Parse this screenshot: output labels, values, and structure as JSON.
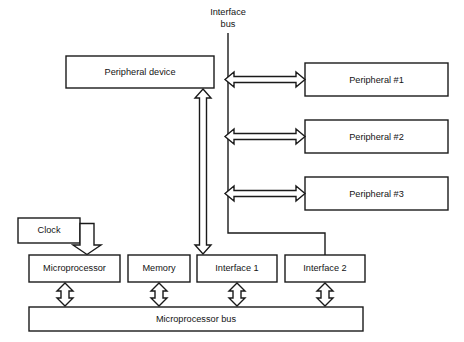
{
  "diagram": {
    "colors": {
      "stroke": "#1a1a1a",
      "fill": "#ffffff",
      "text": "#141414",
      "background": "#ffffff"
    },
    "labels": {
      "interface_bus_line1": "Interface",
      "interface_bus_line2": "bus"
    },
    "boxes": {
      "peripheral_device": "Peripheral device",
      "peripheral_1": "Peripheral #1",
      "peripheral_2": "Peripheral #2",
      "peripheral_3": "Peripheral #3",
      "clock": "Clock",
      "microprocessor": "Microprocessor",
      "memory": "Memory",
      "interface_1": "Interface 1",
      "interface_2": "Interface 2",
      "microprocessor_bus": "Microprocessor bus"
    },
    "connections": [
      {
        "name": "interface-bus-to-peripheral-1",
        "kind": "double-arrow",
        "orientation": "horizontal"
      },
      {
        "name": "interface-bus-to-peripheral-2",
        "kind": "double-arrow",
        "orientation": "horizontal"
      },
      {
        "name": "interface-bus-to-peripheral-3",
        "kind": "double-arrow",
        "orientation": "horizontal"
      },
      {
        "name": "peripheral-device-to-interface-1",
        "kind": "double-arrow",
        "orientation": "vertical"
      },
      {
        "name": "clock-to-microprocessor",
        "kind": "elbow-arrow",
        "orientation": "right-then-down"
      },
      {
        "name": "interface-bus-to-interface-2",
        "kind": "elbow-line",
        "orientation": "down-right-down"
      },
      {
        "name": "microprocessor-to-bus",
        "kind": "double-arrow",
        "orientation": "vertical"
      },
      {
        "name": "memory-to-bus",
        "kind": "double-arrow",
        "orientation": "vertical"
      },
      {
        "name": "interface-1-to-bus",
        "kind": "double-arrow",
        "orientation": "vertical"
      },
      {
        "name": "interface-2-to-bus",
        "kind": "double-arrow",
        "orientation": "vertical"
      }
    ]
  }
}
